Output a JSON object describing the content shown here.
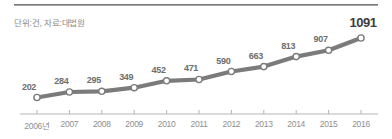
{
  "subtitle": "단위:건, 자료:대법원",
  "chart_data": {
    "type": "line",
    "title": "",
    "subtitle": "단위:건, 자료:대법원",
    "xlabel": "",
    "ylabel": "",
    "categories": [
      "2006년",
      "2007",
      "2008",
      "2009",
      "2010",
      "2011",
      "2012",
      "2013",
      "2014",
      "2015",
      "2016"
    ],
    "values": [
      202,
      284,
      295,
      349,
      452,
      471,
      590,
      663,
      813,
      907,
      1091
    ],
    "point_labels": [
      "202",
      "284",
      "295",
      "349",
      "452",
      "471",
      "590",
      "663",
      "813",
      "907",
      "1091"
    ],
    "ylim": [
      150,
      1150
    ],
    "grid": false,
    "legend": false,
    "series": [
      {
        "name": "건수",
        "values": [
          202,
          284,
          295,
          349,
          452,
          471,
          590,
          663,
          813,
          907,
          1091
        ]
      }
    ],
    "colors": {
      "line": "#7b7b7b",
      "marker_fill": "#ffffff",
      "marker_stroke": "#7b7b7b",
      "label": "#6d6d6d",
      "last_label": "#3d3d3d",
      "axis": "#b5b5b5",
      "rule": "#6e6e6e",
      "subtitle": "#8a8a8a",
      "tick_label": "#8f8f8f"
    }
  }
}
